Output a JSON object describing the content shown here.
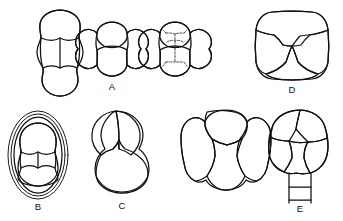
{
  "plate": {
    "title": "Foraminiferal test chamber-arrangement diagrams",
    "background_color": "#ffffff",
    "line_color": "#111111",
    "dashed_line_color": "#333333",
    "width": 343,
    "height": 221,
    "figure_count": 8,
    "labels": {
      "a": "A",
      "b": "B",
      "c": "C",
      "d": "D",
      "e": "E"
    },
    "figures": [
      {
        "id": "fig-elongate-biserial",
        "label": "",
        "description": "Elongate test, side view, stacked chambers with median sutures",
        "row": "top",
        "position": 1
      },
      {
        "id": "fig-a",
        "label": "A",
        "description": "Rounded quadrilobate test, apertural view, four inflated chambers",
        "row": "top",
        "position": 2
      },
      {
        "id": "fig-internal-canal",
        "label": "",
        "description": "Quadrilobate test with dashed internal canal system",
        "row": "top",
        "position": 3
      },
      {
        "id": "fig-d",
        "label": "D",
        "description": "Subquadrate test with three chambers meeting at central Y-suture",
        "row": "top",
        "position": 4
      },
      {
        "id": "fig-b",
        "label": "B",
        "description": "Ovate test with three concentric outer walls enclosing inner chamber cluster",
        "row": "bottom",
        "position": 1
      },
      {
        "id": "fig-c",
        "label": "C",
        "description": "Trilobate trochospiral test, three inflated chambers in final whorl",
        "row": "bottom",
        "position": 2
      },
      {
        "id": "fig-oval-four-chamber",
        "label": "",
        "description": "Oval test, four chambers about a vertical median suture",
        "row": "bottom",
        "position": 3
      },
      {
        "id": "fig-e",
        "label": "E",
        "description": "Globular test with multiple chambers and a rectangular tubular neck below",
        "row": "bottom",
        "position": 4
      }
    ]
  }
}
